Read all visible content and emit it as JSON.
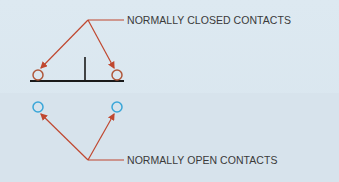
{
  "diagram": {
    "background_color": "#dbe7f0",
    "labels": {
      "normally_closed": "NORMALLY CLOSED CONTACTS",
      "normally_open": "NORMALLY OPEN CONTACTS"
    },
    "colors": {
      "closed_contact": "#b0573a",
      "open_contact": "#3aa6d8",
      "arrow": "#c0472f",
      "line": "#1a1a1a",
      "text": "#3a3a3a"
    },
    "elements": [
      {
        "id": "nc-contact-left",
        "type": "circle",
        "color": "#b0573a"
      },
      {
        "id": "nc-contact-right",
        "type": "circle",
        "color": "#b0573a"
      },
      {
        "id": "nc-bar",
        "type": "line",
        "color": "#1a1a1a"
      },
      {
        "id": "nc-stem",
        "type": "line",
        "color": "#1a1a1a"
      },
      {
        "id": "no-contact-left",
        "type": "circle",
        "color": "#3aa6d8"
      },
      {
        "id": "no-contact-right",
        "type": "circle",
        "color": "#3aa6d8"
      }
    ]
  }
}
